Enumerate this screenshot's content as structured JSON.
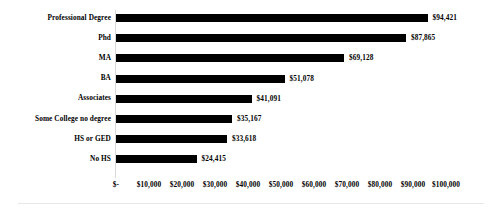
{
  "chart_data": {
    "type": "bar",
    "orientation": "horizontal",
    "title": "",
    "subtitle": "",
    "xlabel": "",
    "ylabel": "",
    "grid": false,
    "legend": false,
    "legend_position": "none",
    "bar_color": "#000000",
    "background_color": "#FFFFFF",
    "text_color": "#000000",
    "axis_line_color": "#D9D9D9",
    "categories": [
      "Professional Degree",
      "Phd",
      "MA",
      "BA",
      "Associates",
      "Some College no degree",
      "HS or GED",
      "No HS"
    ],
    "values": [
      94421,
      87865,
      69128,
      51078,
      41091,
      35167,
      33618,
      24415
    ],
    "value_labels": [
      "$94,421",
      "$87,865",
      "$69,128",
      "$51,078",
      "$41,091",
      "$35,167",
      "$33,618",
      "$24,415"
    ],
    "xlim": [
      0,
      100000
    ],
    "xticks": [
      0,
      10000,
      20000,
      30000,
      40000,
      50000,
      60000,
      70000,
      80000,
      90000,
      100000
    ],
    "xtick_labels": [
      "$-",
      "$10,000",
      "$20,000",
      "$30,000",
      "$40,000",
      "$50,000",
      "$60,000",
      "$70,000",
      "$80,000",
      "$90,000",
      "$100,000"
    ]
  }
}
